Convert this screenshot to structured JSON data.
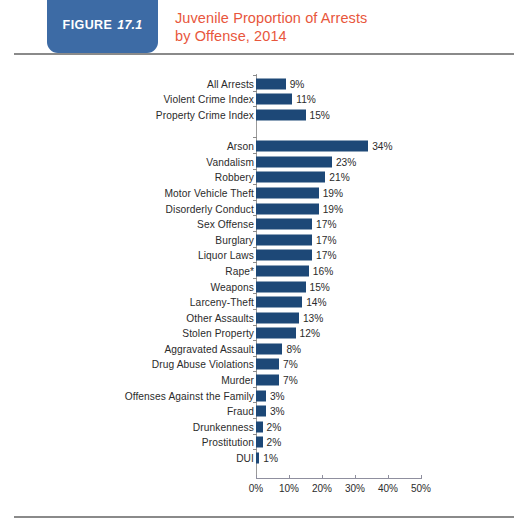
{
  "header": {
    "figure_word": "FIGURE",
    "figure_number": "17.1",
    "title_line1": "Juvenile Proportion of Arrests",
    "title_line2": "by Offense, 2014",
    "badge_color": "#3d6ba5",
    "title_color": "#e8563c"
  },
  "chart_data": {
    "type": "bar",
    "orientation": "horizontal",
    "title": "Juvenile Proportion of Arrests by Offense, 2014",
    "xlabel": "",
    "ylabel": "",
    "xlim": [
      0,
      50
    ],
    "grid": false,
    "legend": null,
    "bar_color": "#1d4877",
    "xticks": [
      0,
      10,
      20,
      30,
      40,
      50
    ],
    "xtick_labels": [
      "0%",
      "10%",
      "20%",
      "30%",
      "40%",
      "50%"
    ],
    "categories": [
      "All Arrests",
      "Violent Crime Index",
      "Property Crime Index",
      "",
      "Arson",
      "Vandalism",
      "Robbery",
      "Motor Vehicle Theft",
      "Disorderly Conduct",
      "Sex Offense",
      "Burglary",
      "Liquor Laws",
      "Rape*",
      "Weapons",
      "Larceny-Theft",
      "Other Assaults",
      "Stolen Property",
      "Aggravated Assault",
      "Drug Abuse Violations",
      "Murder",
      "Offenses Against the Family",
      "Fraud",
      "Drunkenness",
      "Prostitution",
      "DUI"
    ],
    "values": [
      9,
      11,
      15,
      null,
      34,
      23,
      21,
      19,
      19,
      17,
      17,
      17,
      16,
      15,
      14,
      13,
      12,
      8,
      7,
      7,
      3,
      3,
      2,
      2,
      1
    ],
    "value_labels": [
      "9%",
      "11%",
      "15%",
      "",
      "34%",
      "23%",
      "21%",
      "19%",
      "19%",
      "17%",
      "17%",
      "17%",
      "16%",
      "15%",
      "14%",
      "13%",
      "12%",
      "8%",
      "7%",
      "7%",
      "3%",
      "3%",
      "2%",
      "2%",
      "1%"
    ]
  }
}
